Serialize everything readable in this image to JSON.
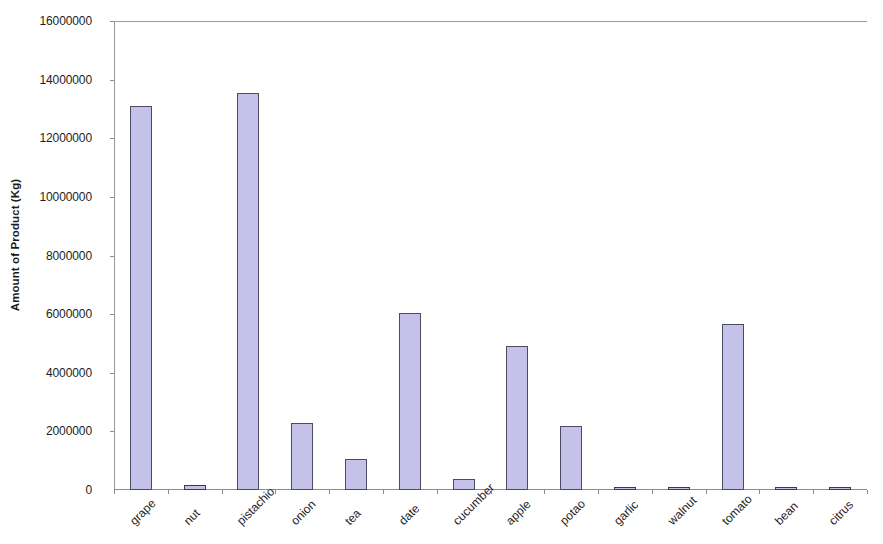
{
  "chart_data": {
    "type": "bar",
    "title": "",
    "xlabel": "",
    "ylabel": "Amount of Product (Kg)",
    "ylim": [
      0,
      16000000
    ],
    "ytick_step": 2000000,
    "ytick_labels": [
      "16000000",
      "14000000",
      "12000000",
      "10000000",
      "8000000",
      "6000000",
      "4000000",
      "2000000",
      "0"
    ],
    "ytick_values": [
      16000000,
      14000000,
      12000000,
      10000000,
      8000000,
      6000000,
      4000000,
      2000000,
      0
    ],
    "grid": false,
    "legend": null,
    "categories": [
      "grape",
      "nut",
      "pistachio",
      "onion",
      "tea",
      "date",
      "cucumber",
      "apple",
      "potao",
      "garlic",
      "walnut",
      "tomato",
      "bean",
      "citrus"
    ],
    "values": [
      13100000,
      180000,
      13550000,
      2280000,
      1050000,
      6050000,
      370000,
      4900000,
      2200000,
      110000,
      110000,
      5650000,
      30000,
      80000
    ],
    "bar_fill_color": "#c5c2e9",
    "bar_border_color": "#4b4b63",
    "axis_color": "#8d8d8d"
  }
}
